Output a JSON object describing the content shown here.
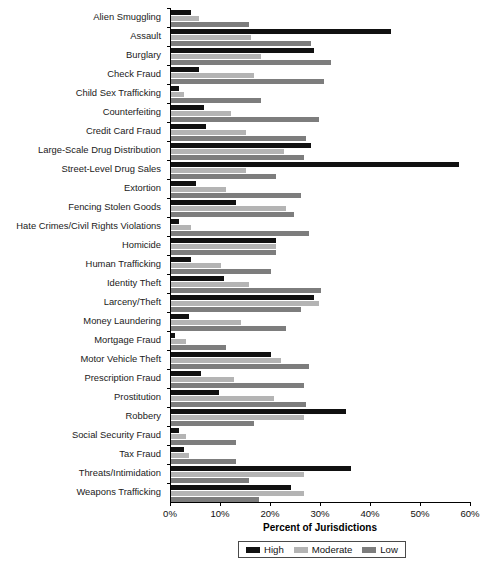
{
  "chart_data": {
    "type": "bar",
    "orientation": "horizontal",
    "title": "",
    "xlabel": "Percent of Jurisdictions",
    "ylabel": "",
    "xlim": [
      0,
      60
    ],
    "xticks": [
      0,
      10,
      20,
      30,
      40,
      50,
      60
    ],
    "xtick_labels": [
      "0%",
      "10%",
      "20%",
      "30%",
      "40%",
      "50%",
      "60%"
    ],
    "grid": false,
    "legend_position": "bottom-center",
    "series_colors": {
      "High": "#111111",
      "Moderate": "#b4b4b4",
      "Low": "#7d7d7d"
    },
    "categories": [
      "Alien Smuggling",
      "Assault",
      "Burglary",
      "Check Fraud",
      "Child Sex Trafficking",
      "Counterfeiting",
      "Credit Card Fraud",
      "Large-Scale Drug Distribution",
      "Street-Level Drug Sales",
      "Extortion",
      "Fencing Stolen Goods",
      "Hate Crimes/Civil Rights Violations",
      "Homicide",
      "Human Trafficking",
      "Identity Theft",
      "Larceny/Theft",
      "Money Laundering",
      "Mortgage Fraud",
      "Motor Vehicle Theft",
      "Prescription Fraud",
      "Prostitution",
      "Robbery",
      "Social Security Fraud",
      "Tax Fraud",
      "Threats/Intimidation",
      "Weapons Trafficking"
    ],
    "series": [
      {
        "name": "High",
        "values": [
          4.0,
          44.0,
          28.5,
          5.5,
          1.6,
          6.5,
          7.0,
          28.0,
          57.5,
          5.0,
          13.0,
          1.6,
          21.0,
          4.0,
          10.5,
          28.5,
          3.5,
          0.8,
          20.0,
          6.0,
          9.5,
          35.0,
          1.5,
          2.5,
          36.0,
          24.0
        ]
      },
      {
        "name": "Moderate",
        "values": [
          5.5,
          16.0,
          18.0,
          16.5,
          2.5,
          12.0,
          15.0,
          22.5,
          15.0,
          11.0,
          23.0,
          4.0,
          21.0,
          10.0,
          15.5,
          29.5,
          14.0,
          3.0,
          22.0,
          12.5,
          20.5,
          26.5,
          3.0,
          3.5,
          26.5,
          26.5
        ]
      },
      {
        "name": "Low",
        "values": [
          15.5,
          28.0,
          32.0,
          30.5,
          18.0,
          29.5,
          27.0,
          26.5,
          21.0,
          26.0,
          24.5,
          27.5,
          21.0,
          20.0,
          30.0,
          26.0,
          23.0,
          11.0,
          27.5,
          26.5,
          27.0,
          16.5,
          13.0,
          13.0,
          15.5,
          17.5
        ]
      }
    ]
  },
  "legend": {
    "entries": [
      {
        "label": "High",
        "color": "#111111"
      },
      {
        "label": "Moderate",
        "color": "#b4b4b4"
      },
      {
        "label": "Low",
        "color": "#7d7d7d"
      }
    ]
  },
  "axis": {
    "x_title": "Percent of Jurisdictions"
  }
}
